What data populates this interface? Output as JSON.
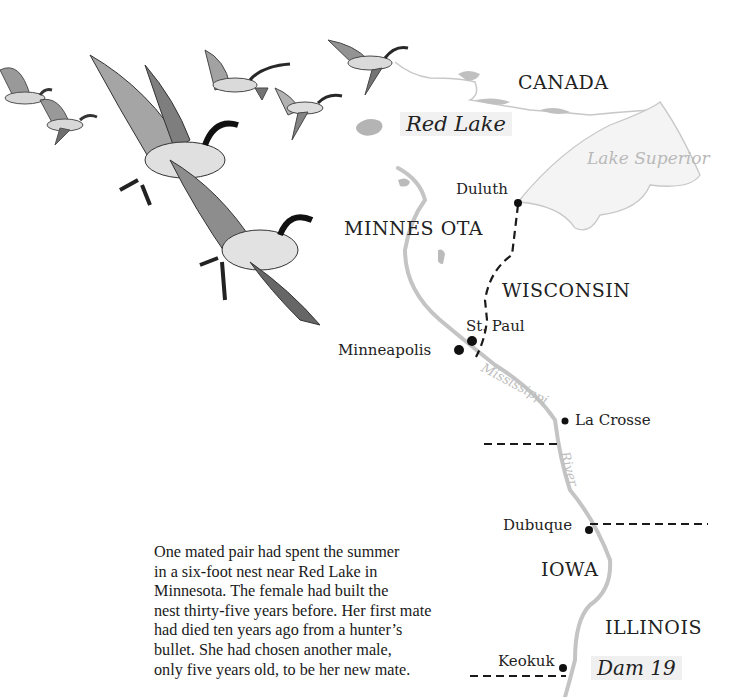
{
  "map": {
    "regions": {
      "canada": "CANADA",
      "minnesota": "MINNES OTA",
      "wisconsin": "WISCONSIN",
      "iowa": "IOWA",
      "illinois": "ILLINOIS"
    },
    "water": {
      "red_lake": "Red Lake",
      "lake_superior": "Lake Superior",
      "river_part1": "Mississippi",
      "river_part2": "River"
    },
    "cities": {
      "duluth": "Duluth",
      "st_paul": "St. Paul",
      "minneapolis": "Minneapolis",
      "la_crosse": "La Crosse",
      "dubuque": "Dubuque",
      "keokuk": "Keokuk"
    },
    "landmarks": {
      "dam": "Dam 19"
    },
    "colors": {
      "river": "#c4c4c4",
      "lake": "#b8b8b8",
      "border": "#1a1a1a",
      "city_dot": "#111111"
    }
  },
  "illustration": {
    "subject": "flock of Canada geese in flight"
  },
  "story": {
    "lines": [
      "One mated pair had spent the summer",
      "in a six-foot nest near Red Lake in",
      "Minnesota.  The female had built the",
      "nest thirty-five years before.  Her first mate",
      "had died ten years ago from a hunter’s",
      "bullet.  She had chosen another male,",
      "only five years old, to be her new mate."
    ]
  }
}
